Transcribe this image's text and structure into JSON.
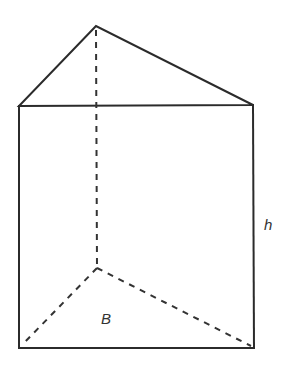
{
  "figure": {
    "type": "triangular-prism",
    "labels": {
      "base": "B",
      "height": "h"
    },
    "colors": {
      "line": "#2b2b2b",
      "background": "#ffffff"
    },
    "vertices": {
      "top_back": [
        96,
        26
      ],
      "top_left": [
        19,
        106
      ],
      "top_right": [
        253,
        105
      ],
      "bottom_back": [
        97,
        268
      ],
      "bottom_left": [
        19,
        348
      ],
      "bottom_right": [
        254,
        348
      ]
    }
  }
}
